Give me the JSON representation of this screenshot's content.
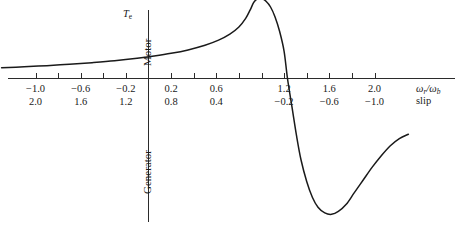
{
  "chart_data": {
    "type": "line",
    "title": "",
    "subtitle": "",
    "ylabel": "Te",
    "ylabel_upper_region": "Motor",
    "ylabel_lower_region": "Generator",
    "xlabel_primary": "wr/wb",
    "xlabel_secondary": "slip",
    "grid": false,
    "legend": "none",
    "xlim": [
      -1.3,
      2.3
    ],
    "ylim": [
      -1.0,
      0.62
    ],
    "x_axis_primary_ticks": [
      -1.0,
      -0.8,
      -0.6,
      -0.4,
      -0.2,
      0.0,
      0.2,
      0.4,
      0.6,
      0.8,
      1.0,
      1.2,
      1.4,
      1.6,
      1.8,
      2.0
    ],
    "x_axis_primary_labeled": [
      {
        "value": -1.0,
        "label": "−1.0"
      },
      {
        "value": -0.6,
        "label": "−0.6"
      },
      {
        "value": -0.2,
        "label": "−0.2"
      },
      {
        "value": 0.2,
        "label": "0.2"
      },
      {
        "value": 0.6,
        "label": "0.6"
      },
      {
        "value": 1.2,
        "label": "1.2"
      },
      {
        "value": 1.6,
        "label": "1.6"
      },
      {
        "value": 2.0,
        "label": "2.0"
      }
    ],
    "x_axis_secondary_labeled": [
      {
        "value": -1.0,
        "label": "2.0"
      },
      {
        "value": -0.6,
        "label": "1.6"
      },
      {
        "value": -0.2,
        "label": "1.2"
      },
      {
        "value": 0.2,
        "label": "0.8"
      },
      {
        "value": 0.6,
        "label": "0.4"
      },
      {
        "value": 1.2,
        "label": "−0.2"
      },
      {
        "value": 1.6,
        "label": "−0.6"
      },
      {
        "value": 2.0,
        "label": "−1.0"
      }
    ],
    "series": [
      {
        "name": "electromagnetic-torque",
        "points": [
          [
            -1.3,
            0.075
          ],
          [
            -1.1,
            0.082
          ],
          [
            -0.9,
            0.09
          ],
          [
            -0.7,
            0.1
          ],
          [
            -0.5,
            0.111
          ],
          [
            -0.3,
            0.124
          ],
          [
            -0.1,
            0.141
          ],
          [
            0.05,
            0.157
          ],
          [
            0.2,
            0.176
          ],
          [
            0.35,
            0.2
          ],
          [
            0.5,
            0.232
          ],
          [
            0.62,
            0.268
          ],
          [
            0.72,
            0.31
          ],
          [
            0.8,
            0.36
          ],
          [
            0.86,
            0.42
          ],
          [
            0.9,
            0.48
          ],
          [
            0.93,
            0.53
          ],
          [
            0.96,
            0.555
          ],
          [
            1.0,
            0.56
          ],
          [
            1.04,
            0.54
          ],
          [
            1.08,
            0.5
          ],
          [
            1.12,
            0.43
          ],
          [
            1.16,
            0.33
          ],
          [
            1.2,
            0.19
          ],
          [
            1.23,
            0.0
          ],
          [
            1.27,
            -0.2
          ],
          [
            1.31,
            -0.4
          ],
          [
            1.35,
            -0.57
          ],
          [
            1.4,
            -0.72
          ],
          [
            1.45,
            -0.83
          ],
          [
            1.5,
            -0.9
          ],
          [
            1.56,
            -0.94
          ],
          [
            1.62,
            -0.95
          ],
          [
            1.68,
            -0.93
          ],
          [
            1.75,
            -0.88
          ],
          [
            1.82,
            -0.8
          ],
          [
            1.9,
            -0.71
          ],
          [
            1.98,
            -0.62
          ],
          [
            2.06,
            -0.54
          ],
          [
            2.14,
            -0.47
          ],
          [
            2.22,
            -0.42
          ],
          [
            2.3,
            -0.39
          ]
        ]
      }
    ],
    "annotations": [
      {
        "name": "breakdown-torque-motoring",
        "approx_x": 1.0,
        "approx_y": 0.56
      },
      {
        "name": "breakdown-torque-generating",
        "approx_x": 1.62,
        "approx_y": -0.95
      },
      {
        "name": "zero-torque-synchronous-speed",
        "approx_x": 1.23,
        "approx_y": 0.0
      }
    ]
  }
}
